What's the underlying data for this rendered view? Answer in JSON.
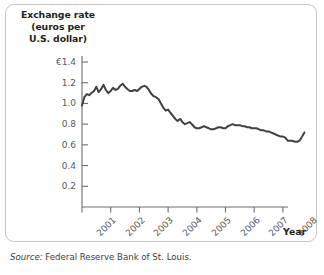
{
  "figure": {
    "axis_title_lines": [
      "Exchange rate",
      "(euros per",
      "U.S. dollar)"
    ],
    "axis_title_full": "Exchange rate (euros per U.S. dollar)",
    "source_prefix": "Source:",
    "source_text": "Federal Reserve Bank of St. Louis.",
    "x_axis_name": "Year",
    "frame_color": "#c9c6c4",
    "line_color": "#414042",
    "tick_color": "#6d6e71",
    "label_color": "#58595b"
  },
  "chart_data": {
    "type": "line",
    "title": "Exchange rate (euros per U.S. dollar)",
    "xlabel": "Year",
    "ylabel": "Exchange rate (euros per U.S. dollar)",
    "grid": false,
    "legend": "none",
    "ylim": [
      0,
      1.4
    ],
    "xlim": [
      2001,
      2008.75
    ],
    "ytick_values": [
      1.4,
      1.2,
      1.0,
      0.8,
      0.6,
      0.4,
      0.2
    ],
    "ytick_labels": [
      "€1.4",
      "1.2",
      "1.0",
      "0.8",
      "0.6",
      "0.4",
      "0.2"
    ],
    "xtick_values": [
      2001,
      2002,
      2003,
      2004,
      2005,
      2006,
      2007,
      2008
    ],
    "xtick_labels": [
      "2001",
      "2002",
      "2003",
      "2004",
      "2005",
      "2006",
      "2007",
      "2008"
    ],
    "series": [
      {
        "name": "Euros per U.S. dollar",
        "x": [
          2001.0,
          2001.08,
          2001.17,
          2001.25,
          2001.33,
          2001.42,
          2001.5,
          2001.58,
          2001.67,
          2001.75,
          2001.83,
          2001.92,
          2002.0,
          2002.08,
          2002.17,
          2002.25,
          2002.33,
          2002.42,
          2002.5,
          2002.58,
          2002.67,
          2002.75,
          2002.83,
          2002.92,
          2003.0,
          2003.08,
          2003.17,
          2003.25,
          2003.33,
          2003.42,
          2003.5,
          2003.58,
          2003.67,
          2003.75,
          2003.83,
          2003.92,
          2004.0,
          2004.08,
          2004.17,
          2004.25,
          2004.33,
          2004.42,
          2004.5,
          2004.58,
          2004.67,
          2004.75,
          2004.83,
          2004.92,
          2005.0,
          2005.08,
          2005.17,
          2005.25,
          2005.33,
          2005.42,
          2005.5,
          2005.58,
          2005.67,
          2005.75,
          2005.83,
          2005.92,
          2006.0,
          2006.08,
          2006.17,
          2006.25,
          2006.33,
          2006.42,
          2006.5,
          2006.58,
          2006.67,
          2006.75,
          2006.83,
          2006.92,
          2007.0,
          2007.08,
          2007.17,
          2007.25,
          2007.33,
          2007.42,
          2007.5,
          2007.58,
          2007.67,
          2007.75,
          2007.83,
          2007.92,
          2008.0,
          2008.08,
          2008.17,
          2008.25,
          2008.33,
          2008.42,
          2008.5,
          2008.58,
          2008.67,
          2008.75
        ],
        "y": [
          0.98,
          1.06,
          1.09,
          1.08,
          1.1,
          1.12,
          1.16,
          1.11,
          1.14,
          1.18,
          1.13,
          1.1,
          1.12,
          1.15,
          1.13,
          1.14,
          1.17,
          1.19,
          1.16,
          1.14,
          1.12,
          1.12,
          1.13,
          1.12,
          1.14,
          1.16,
          1.17,
          1.16,
          1.13,
          1.09,
          1.07,
          1.06,
          1.04,
          1.0,
          0.96,
          0.93,
          0.94,
          0.91,
          0.88,
          0.85,
          0.83,
          0.85,
          0.82,
          0.8,
          0.81,
          0.82,
          0.8,
          0.77,
          0.76,
          0.76,
          0.77,
          0.78,
          0.77,
          0.76,
          0.75,
          0.75,
          0.76,
          0.77,
          0.77,
          0.76,
          0.76,
          0.78,
          0.79,
          0.8,
          0.79,
          0.79,
          0.79,
          0.78,
          0.78,
          0.77,
          0.77,
          0.76,
          0.76,
          0.76,
          0.75,
          0.74,
          0.74,
          0.73,
          0.73,
          0.72,
          0.71,
          0.7,
          0.69,
          0.68,
          0.68,
          0.67,
          0.64,
          0.64,
          0.64,
          0.63,
          0.63,
          0.64,
          0.68,
          0.72
        ]
      }
    ]
  }
}
